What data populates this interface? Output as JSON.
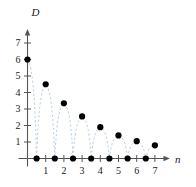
{
  "chart_data": {
    "type": "scatter",
    "title": "",
    "subtitle": "",
    "xlabel": "n",
    "ylabel": "D",
    "xlim": [
      -0.35,
      7.6
    ],
    "ylim": [
      -0.55,
      7.6
    ],
    "grid": false,
    "legend": null,
    "x_ticks": [
      1,
      2,
      3,
      4,
      5,
      6,
      7
    ],
    "x_tick_labels": [
      "1",
      "2",
      "3",
      "4",
      "5",
      "6",
      "7"
    ],
    "y_ticks": [
      1,
      2,
      3,
      4,
      5,
      6,
      7
    ],
    "y_tick_labels": [
      "1",
      "2",
      "3",
      "4",
      "5",
      "6",
      "7"
    ],
    "series": [
      {
        "name": "D(n) samples",
        "marker": "filled-circle",
        "marker_color": "#000000",
        "x": [
          0,
          0.5,
          1,
          1.5,
          2,
          2.5,
          3,
          3.5,
          4,
          4.5,
          5,
          5.5,
          6,
          6.5,
          7
        ],
        "values": [
          6,
          0,
          4.5,
          0,
          3.35,
          0,
          2.55,
          0,
          1.9,
          0,
          1.4,
          0,
          1.05,
          0,
          0.8
        ]
      },
      {
        "name": "envelope-dashed-curve",
        "style": "dashed",
        "color": "#b9d0e8",
        "description": "light blue dashed interpolating curve through the sample points"
      }
    ],
    "annotations": []
  },
  "figure": {
    "y_axis_label": "D",
    "x_axis_label": "n",
    "axis_color": "#555555",
    "dash_color": "#b9d0e8",
    "point_color": "#000000",
    "background": "#ffffff"
  }
}
